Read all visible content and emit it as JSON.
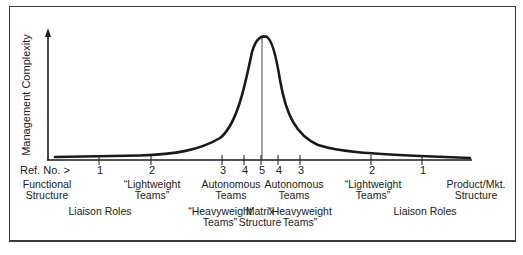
{
  "diagram": {
    "y_axis_label": "Management Complexity",
    "ref_label": "Ref. No. >",
    "ticks": [
      {
        "num": "1",
        "x": 99
      },
      {
        "num": "2",
        "x": 151
      },
      {
        "num": "3",
        "x": 222
      },
      {
        "num": "4",
        "x": 244
      },
      {
        "num": "5",
        "x": 261
      },
      {
        "num": "4",
        "x": 278
      },
      {
        "num": "3",
        "x": 300
      },
      {
        "num": "2",
        "x": 371
      },
      {
        "num": "1",
        "x": 422
      }
    ],
    "row1": [
      {
        "line1": "Functional",
        "line2": "Structure",
        "x": 47
      },
      {
        "line1": "“Lightweight",
        "line2": "Teams”",
        "x": 152
      },
      {
        "line1": "Autonomous",
        "line2": "Teams",
        "x": 231
      },
      {
        "line1": "Autonomous",
        "line2": "Teams",
        "x": 294
      },
      {
        "line1": "“Lightweight",
        "line2": "Teams”",
        "x": 373
      },
      {
        "line1": "Product/Mkt.",
        "line2": "Structure",
        "x": 476
      }
    ],
    "row2": [
      {
        "line1": "Liaison Roles",
        "line2": "",
        "x": 100
      },
      {
        "line1": "“Heavyweight",
        "line2": "Teams”",
        "x": 220
      },
      {
        "line1": "Matrix",
        "line2": "Structure",
        "x": 260
      },
      {
        "line1": "“Heavyweight",
        "line2": "Teams”",
        "x": 300
      },
      {
        "line1": "Liaison Roles",
        "line2": "",
        "x": 425
      }
    ],
    "colors": {
      "line": "#1a1a1a",
      "frame": "#3a3a3a"
    }
  }
}
